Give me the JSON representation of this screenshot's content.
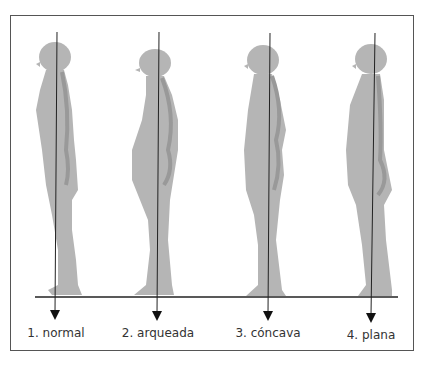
{
  "figure": {
    "colors": {
      "body": "#b3b3b3",
      "spine": "#9a9a9a",
      "line": "#222222",
      "frame": "#555555"
    },
    "postures": [
      {
        "id": 1,
        "label": "1. normal",
        "plumb_x": 57
      },
      {
        "id": 2,
        "label": "2. arqueada",
        "plumb_x": 159
      },
      {
        "id": 3,
        "label": "3. cóncava",
        "plumb_x": 270
      },
      {
        "id": 4,
        "label": "4. plana",
        "plumb_x": 375
      }
    ]
  }
}
